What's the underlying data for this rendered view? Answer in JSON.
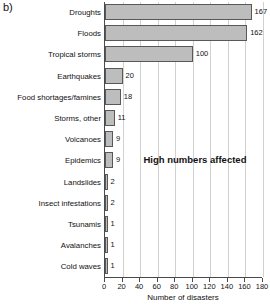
{
  "panel_label": "b)",
  "chart_data": {
    "type": "bar",
    "orientation": "horizontal",
    "title": "",
    "xlabel": "Number of disasters",
    "ylabel": "",
    "xlim": [
      0,
      180
    ],
    "xticks": [
      0,
      20,
      40,
      60,
      80,
      100,
      120,
      140,
      160,
      180
    ],
    "grid": true,
    "legend": "none",
    "bar_color": "#bdbdbd",
    "bar_edge_color": "#585858",
    "categories": [
      "Droughts",
      "Floods",
      "Tropical storms",
      "Earthquakes",
      "Food shortages/famines",
      "Storms, other",
      "Volcanoes",
      "Epidemics",
      "Landslides",
      "Insect infestations",
      "Tsunamis",
      "Avalanches",
      "Cold waves"
    ],
    "values": [
      167,
      162,
      100,
      20,
      18,
      11,
      9,
      9,
      2,
      2,
      1,
      1,
      1
    ],
    "value_labels": [
      "167",
      "162",
      "100",
      "20",
      "18",
      "11",
      "9",
      "9",
      "2",
      "2",
      "1",
      "1",
      "1"
    ],
    "annotations": [
      {
        "text": "High numbers affected",
        "x": 45,
        "category": "Epidemics"
      }
    ]
  }
}
